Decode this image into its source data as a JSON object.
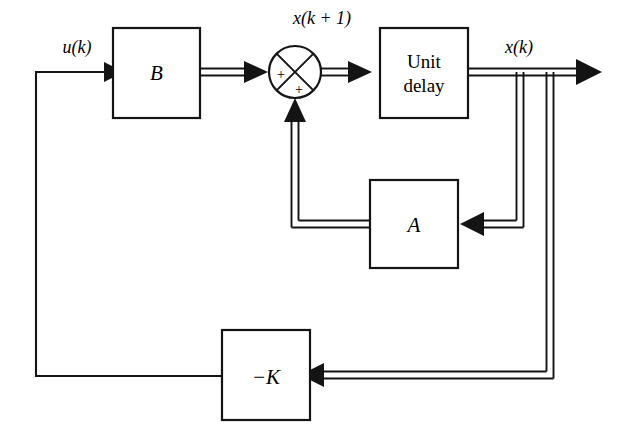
{
  "diagram": {
    "type": "block-diagram",
    "canvas": {
      "width": 618,
      "height": 439,
      "background": "#ffffff"
    },
    "line_color": "#141414",
    "blocks": [
      {
        "id": "B",
        "label": "B",
        "style": "italic",
        "x": 113,
        "y": 28,
        "w": 87,
        "h": 90
      },
      {
        "id": "unit_delay",
        "label_line1": "Unit",
        "label_line2": "delay",
        "style": "roman",
        "x": 380,
        "y": 28,
        "w": 88,
        "h": 90
      },
      {
        "id": "A",
        "label": "A",
        "style": "italic",
        "x": 370,
        "y": 180,
        "w": 88,
        "h": 88
      },
      {
        "id": "K",
        "label": "−K",
        "style": "italic",
        "x": 222,
        "y": 330,
        "w": 88,
        "h": 90
      }
    ],
    "summing_junction": {
      "id": "sum",
      "cx": 295,
      "cy": 72,
      "r": 26,
      "cross": "x-cross",
      "signs": [
        {
          "label": "+",
          "quadrant": "left",
          "x": 279,
          "y": 78
        },
        {
          "label": "+",
          "quadrant": "bottom",
          "x": 297,
          "y": 93
        }
      ]
    },
    "signal_labels": [
      {
        "id": "u_k",
        "text": "u(k)",
        "x": 77,
        "y": 52,
        "anchor": "middle"
      },
      {
        "id": "x_k_plus_1",
        "text": "x(k + 1)",
        "x": 320,
        "y": 23,
        "anchor": "middle"
      },
      {
        "id": "x_k",
        "text": "x(k)",
        "x": 518,
        "y": 52,
        "anchor": "middle"
      }
    ],
    "connections": [
      {
        "id": "u-to-B",
        "from": "feedback-corner",
        "to": "B",
        "kind": "single",
        "label": "u(k)"
      },
      {
        "id": "B-to-sum",
        "from": "B",
        "to": "sum",
        "kind": "double"
      },
      {
        "id": "sum-to-delay",
        "from": "sum",
        "to": "unit_delay",
        "kind": "double"
      },
      {
        "id": "delay-to-out",
        "from": "unit_delay",
        "to": "output",
        "kind": "double",
        "label": "x(k)"
      },
      {
        "id": "branch-inner-to-A",
        "from": "output-bus",
        "to": "A",
        "kind": "double"
      },
      {
        "id": "A-to-sum",
        "from": "A",
        "to": "sum",
        "kind": "double"
      },
      {
        "id": "branch-outer-to-K",
        "from": "output-bus",
        "to": "K",
        "kind": "double"
      },
      {
        "id": "K-to-u",
        "from": "K",
        "to": "u-input",
        "kind": "single"
      }
    ]
  }
}
